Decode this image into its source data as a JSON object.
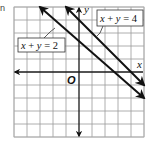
{
  "problem_label": "n",
  "chart_data": {
    "type": "line",
    "title": "",
    "xlabel": "x",
    "ylabel": "y",
    "origin_label": "O",
    "xlim": [
      -5,
      5
    ],
    "ylim": [
      -5,
      5
    ],
    "grid": true,
    "tick_labels_shown": false,
    "series": [
      {
        "name": "x + y = 2",
        "equation": "x + y = 2",
        "slope": -1,
        "intercept": 2,
        "arrows": "both",
        "label": "x + y = 2"
      },
      {
        "name": "x + y = 4",
        "equation": "x + y = 4",
        "slope": -1,
        "intercept": 4,
        "arrows": "both",
        "label": "x + y = 4"
      }
    ]
  }
}
